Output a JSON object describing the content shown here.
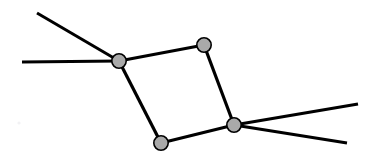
{
  "figure": {
    "title": "",
    "type": "node-link-graph",
    "width": 376,
    "height": 164,
    "background_color": "#ffffff"
  },
  "style": {
    "edge_color": "#000000",
    "edge_width": 3.2,
    "pendant_edge_width": 3.0,
    "node_fill": "#a9a9a9",
    "node_stroke": "#000000",
    "node_stroke_width": 1.6,
    "node_radius": 7.2,
    "speck_color": "#f2f2f4"
  },
  "graph": {
    "nodes": [
      {
        "id": "n1",
        "name": "left-junction-node",
        "label": "",
        "x": 119,
        "y": 61
      },
      {
        "id": "n2",
        "name": "top-right-node",
        "label": "",
        "x": 204,
        "y": 45
      },
      {
        "id": "n3",
        "name": "right-junction-node",
        "label": "",
        "x": 234,
        "y": 125
      },
      {
        "id": "n4",
        "name": "bottom-left-node",
        "label": "",
        "x": 161,
        "y": 143
      }
    ],
    "edges": [
      {
        "id": "e1",
        "name": "edge-left-to-topright",
        "label": "",
        "x1": 119,
        "y1": 61,
        "x2": 204,
        "y2": 45,
        "kind": "internal"
      },
      {
        "id": "e2",
        "name": "edge-topright-to-right",
        "label": "",
        "x1": 204,
        "y1": 45,
        "x2": 234,
        "y2": 125,
        "kind": "internal"
      },
      {
        "id": "e3",
        "name": "edge-right-to-bottomleft",
        "label": "",
        "x1": 234,
        "y1": 125,
        "x2": 161,
        "y2": 143,
        "kind": "internal"
      },
      {
        "id": "e4",
        "name": "edge-bottomleft-to-left",
        "label": "",
        "x1": 161,
        "y1": 143,
        "x2": 119,
        "y2": 61,
        "kind": "internal"
      }
    ],
    "pendant_edges": [
      {
        "id": "p1",
        "name": "pendant-edge-upper-left",
        "label": "",
        "x1": 119,
        "y1": 61,
        "x2": 37,
        "y2": 13
      },
      {
        "id": "p2",
        "name": "pendant-edge-horizontal-left",
        "label": "",
        "x1": 119,
        "y1": 61,
        "x2": 22,
        "y2": 62
      },
      {
        "id": "p3",
        "name": "pendant-edge-upper-right",
        "label": "",
        "x1": 234,
        "y1": 125,
        "x2": 358,
        "y2": 104
      },
      {
        "id": "p4",
        "name": "pendant-edge-lower-right",
        "label": "",
        "x1": 234,
        "y1": 125,
        "x2": 347,
        "y2": 143
      }
    ],
    "artifacts": [
      {
        "id": "a1",
        "name": "faint-speck",
        "label": "",
        "x": 19,
        "y": 123,
        "r": 1.6
      }
    ]
  }
}
